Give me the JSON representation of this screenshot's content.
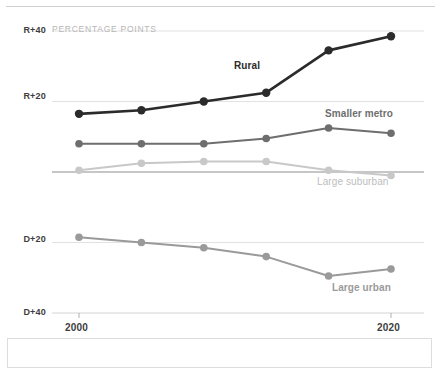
{
  "chart_data": {
    "type": "line",
    "title": "",
    "subtitle": "PERCENTAGE POINTS",
    "xlabel": "",
    "ylabel": "",
    "x": [
      2000,
      2004,
      2008,
      2012,
      2016,
      2020
    ],
    "x_tick_labels": [
      "2000",
      "2020"
    ],
    "x_ticks_shown": [
      2000,
      2020
    ],
    "y_tick_labels": [
      "R+40",
      "R+20",
      "D+20",
      "D+40"
    ],
    "y_tick_values": [
      40,
      20,
      -20,
      -40
    ],
    "ylim": [
      -40,
      40
    ],
    "zero_line": 0,
    "grid": true,
    "legend_position": "inline-labels",
    "series": [
      {
        "name": "Rural",
        "color": "#2b2b2b",
        "values": [
          16.5,
          17.5,
          20.0,
          22.5,
          34.5,
          38.5
        ]
      },
      {
        "name": "Smaller metro",
        "color": "#6e6e6e",
        "values": [
          8.0,
          8.0,
          8.0,
          9.5,
          12.5,
          11.0
        ]
      },
      {
        "name": "Large suburban",
        "color": "#c8c8c8",
        "values": [
          0.5,
          2.5,
          3.0,
          3.0,
          0.5,
          -1.0
        ]
      },
      {
        "name": "Large urban",
        "color": "#9a9a9a",
        "values": [
          -18.5,
          -20.0,
          -21.5,
          -24.0,
          -29.5,
          -27.5
        ]
      }
    ]
  },
  "annotations": {
    "rural_label": "Rural",
    "smaller_metro_label": "Smaller metro",
    "large_suburban_label": "Large suburban",
    "large_urban_label": "Large urban"
  },
  "axis": {
    "r40": "R+40",
    "r20": "R+20",
    "d20": "D+20",
    "d40": "D+40",
    "year_start": "2000",
    "year_end": "2020"
  },
  "colors": {
    "rural": "#2b2b2b",
    "smaller_metro": "#6e6e6e",
    "large_suburban": "#c8c8c8",
    "large_urban": "#9a9a9a",
    "gridline": "#e2e2e2",
    "zero_line": "#8d8d8d",
    "axis_text": "#3d3d3d",
    "subtitle_text": "#b6b6b6"
  }
}
